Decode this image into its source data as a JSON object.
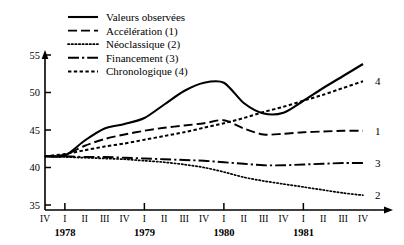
{
  "chart_data": {
    "type": "line",
    "title": "",
    "subtitle": "",
    "xlabel": "",
    "ylabel": "",
    "ylim": [
      35,
      56
    ],
    "xlim": [
      0,
      16
    ],
    "grid": false,
    "legend_position": "top-left",
    "y_ticks": [
      "35",
      "40",
      "45",
      "50",
      "55"
    ],
    "y_tick_values": [
      35,
      40,
      45,
      50,
      55
    ],
    "x": [
      "IV",
      "I",
      "II",
      "III",
      "IV",
      "I",
      "II",
      "III",
      "IV",
      "I",
      "II",
      "III",
      "IV",
      "I",
      "II",
      "III",
      "IV"
    ],
    "x_quarter_labels": [
      "IV",
      "I",
      "II",
      "III",
      "IV",
      "I",
      "II",
      "III",
      "IV",
      "I",
      "II",
      "III",
      "IV",
      "I",
      "II",
      "III",
      "IV"
    ],
    "x_year_labels": [
      {
        "label": "1978",
        "index": 1
      },
      {
        "label": "1979",
        "index": 5
      },
      {
        "label": "1980",
        "index": 9
      },
      {
        "label": "1981",
        "index": 13
      }
    ],
    "series": [
      {
        "name": "Valeurs observées",
        "style": "solid",
        "end_label": "",
        "values": [
          41.5,
          41.6,
          43.6,
          45.2,
          45.8,
          46.6,
          48.4,
          50.2,
          51.3,
          51.3,
          48.6,
          47.2,
          47.3,
          48.9,
          50.6,
          52.2,
          53.8
        ]
      },
      {
        "name": "Accélération (1)",
        "style": "dashed",
        "end_label": "1",
        "values": [
          41.5,
          41.7,
          42.9,
          43.8,
          44.4,
          44.9,
          45.3,
          45.6,
          45.9,
          46.3,
          45.2,
          44.4,
          44.5,
          44.7,
          44.8,
          44.9,
          44.9
        ]
      },
      {
        "name": "Néoclassique (2)",
        "style": "dotted",
        "end_label": "2",
        "values": [
          41.5,
          41.4,
          41.3,
          41.2,
          41.1,
          40.9,
          40.7,
          40.4,
          40.0,
          39.4,
          38.7,
          38.2,
          37.8,
          37.4,
          37.0,
          36.6,
          36.3
        ]
      },
      {
        "name": "Financement (3)",
        "style": "dashdot",
        "end_label": "3",
        "values": [
          41.5,
          41.5,
          41.4,
          41.4,
          41.3,
          41.2,
          41.1,
          41.0,
          40.9,
          40.7,
          40.5,
          40.3,
          40.3,
          40.4,
          40.5,
          40.6,
          40.6
        ]
      },
      {
        "name": "Chronologique (4)",
        "style": "densely-dotted",
        "end_label": "4",
        "values": [
          41.5,
          41.8,
          42.3,
          42.8,
          43.2,
          43.7,
          44.2,
          44.7,
          45.3,
          45.9,
          46.6,
          47.4,
          48.1,
          48.9,
          49.7,
          50.6,
          51.5
        ]
      }
    ]
  },
  "legend": {
    "items": [
      {
        "label": "Valeurs observées",
        "style": "solid"
      },
      {
        "label": "Accélération (1)",
        "style": "dashed"
      },
      {
        "label": "Néoclassique (2)",
        "style": "dotted"
      },
      {
        "label": "Financement (3)",
        "style": "dashdot"
      },
      {
        "label": "Chronologique (4)",
        "style": "densely-dotted"
      }
    ]
  },
  "colors": {
    "ink": "#000000",
    "background": "#ffffff"
  }
}
